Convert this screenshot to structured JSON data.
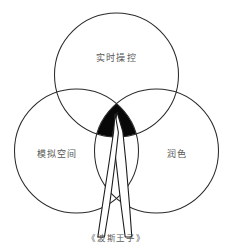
{
  "diagram": {
    "type": "venn-3-circle",
    "background_color": "#ffffff",
    "stroke_color": "#2b2b2b",
    "highlight_color": "#080808",
    "text_color": "#4a4a4a",
    "circles": [
      {
        "id": "top",
        "label": "实时操控",
        "cx": 116.5,
        "cy": 75,
        "r": 62
      },
      {
        "id": "left",
        "label": "模拟空间",
        "cx": 76.5,
        "cy": 151,
        "r": 62
      },
      {
        "id": "right",
        "label": "润色",
        "cx": 156.5,
        "cy": 151,
        "r": 62
      }
    ],
    "center_intersection": {
      "filled": true,
      "label": ""
    },
    "annotation": {
      "arrow": "arrow-pointing-up",
      "caption": "《波斯王子》"
    }
  }
}
